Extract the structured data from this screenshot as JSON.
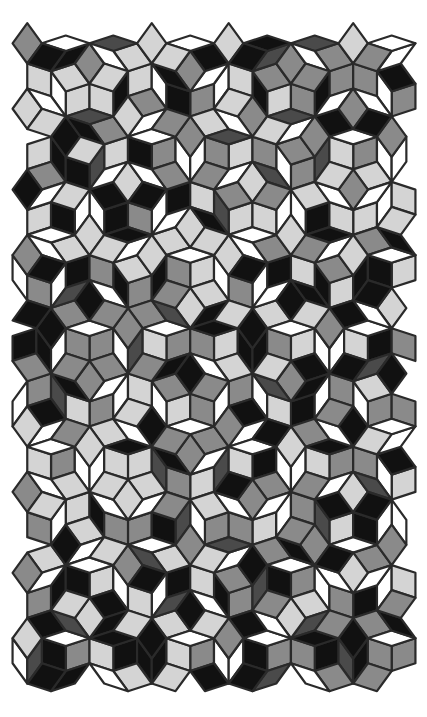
{
  "image": {
    "kind": "Penrose rhombus tiling (P3), grayscale",
    "width": 427,
    "height": 717
  },
  "tiling": {
    "region": {
      "x": 14,
      "y": 26,
      "width": 400,
      "height": 670
    },
    "edge_length": 25,
    "stroke_color": "#2a2a2a",
    "stroke_width": 2.2,
    "background": "#ffffff",
    "palette": {
      "white": "#ffffff",
      "light_gray": "#d4d4d4",
      "mid_gray": "#8a8a8a",
      "dark_gray": "#4a4a4a",
      "black": "#111111"
    },
    "thin_rhomb_colors": [
      "white",
      "white",
      "black",
      "dark_gray",
      "white"
    ],
    "thick_rhomb_colors": [
      "light_gray",
      "mid_gray",
      "black",
      "light_gray",
      "mid_gray"
    ],
    "offsets": [
      0.21,
      0.33,
      0.14,
      0.52,
      -0.2
    ]
  }
}
